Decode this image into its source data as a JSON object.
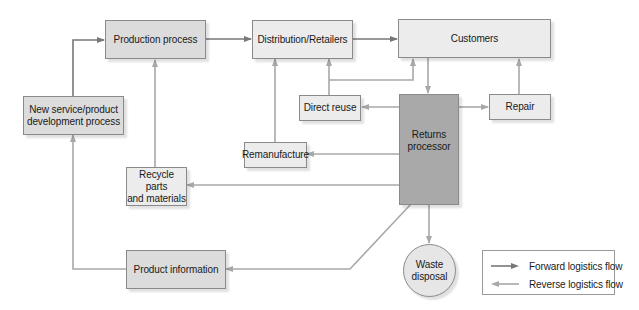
{
  "diagram": {
    "colors": {
      "forward": "#777777",
      "reverse": "#a8a8a8",
      "box_light": "#ececec",
      "box_mid": "#dcdcdc",
      "box_dark": "#a9a9a9"
    },
    "nodes": {
      "new_service": {
        "label": "New service/product\ndevelopment process"
      },
      "production": {
        "label": "Production process"
      },
      "distribution": {
        "label": "Distribution/Retailers"
      },
      "customers": {
        "label": "Customers"
      },
      "direct_reuse": {
        "label": "Direct reuse"
      },
      "repair": {
        "label": "Repair"
      },
      "remanufacture": {
        "label": "Remanufacture"
      },
      "returns_processor": {
        "label": "Returns\nprocessor"
      },
      "recycle": {
        "label": "Recycle parts\nand materials"
      },
      "product_information": {
        "label": "Product information"
      },
      "waste_disposal": {
        "label": "Waste\ndisposal"
      }
    },
    "edges": [
      {
        "from": "New service/product development process",
        "to": "Production process",
        "type": "forward"
      },
      {
        "from": "Production process",
        "to": "Distribution/Retailers",
        "type": "forward"
      },
      {
        "from": "Distribution/Retailers",
        "to": "Customers",
        "type": "forward"
      },
      {
        "from": "Customers",
        "to": "Returns processor",
        "type": "reverse"
      },
      {
        "from": "Returns processor",
        "to": "Direct reuse",
        "type": "reverse"
      },
      {
        "from": "Direct reuse",
        "to": "Distribution/Retailers",
        "type": "reverse"
      },
      {
        "from": "Direct reuse",
        "to": "Customers",
        "type": "reverse"
      },
      {
        "from": "Returns processor",
        "to": "Repair",
        "type": "reverse"
      },
      {
        "from": "Repair",
        "to": "Customers",
        "type": "reverse"
      },
      {
        "from": "Returns processor",
        "to": "Remanufacture",
        "type": "reverse"
      },
      {
        "from": "Remanufacture",
        "to": "Distribution/Retailers",
        "type": "reverse"
      },
      {
        "from": "Returns processor",
        "to": "Recycle parts and materials",
        "type": "reverse"
      },
      {
        "from": "Recycle parts and materials",
        "to": "Production process",
        "type": "reverse"
      },
      {
        "from": "Returns processor",
        "to": "Waste disposal",
        "type": "reverse"
      },
      {
        "from": "Returns processor",
        "to": "Product information",
        "type": "reverse"
      },
      {
        "from": "Product information",
        "to": "New service/product development process",
        "type": "reverse"
      }
    ],
    "legend": {
      "forward_label": "Forward logistics flow",
      "reverse_label": "Reverse logistics flow"
    }
  }
}
